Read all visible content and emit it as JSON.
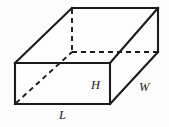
{
  "figure": {
    "shape_type": "rectangular-prism",
    "background_color": "#fcfcfc",
    "line_color": "#1b1b1b",
    "face_color": "#fdfdfd"
  },
  "labels": {
    "height": "H",
    "width": "W",
    "length": "L"
  },
  "geometry": {
    "front_face": {
      "top_left": [
        15,
        63
      ],
      "top_right": [
        110,
        63
      ],
      "bottom_right": [
        110,
        104
      ],
      "bottom_left": [
        15,
        104
      ]
    },
    "back_face": {
      "top_left": [
        72,
        8
      ],
      "top_right": [
        158,
        8
      ],
      "bottom_right": [
        158,
        52
      ],
      "bottom_left": [
        72,
        52
      ]
    },
    "visible_edges": [
      "front-top",
      "front-right",
      "front-bottom",
      "front-left",
      "top-left-slant",
      "top-back",
      "top-right-slant",
      "right-lower-slant",
      "back-right-vertical"
    ],
    "hidden_edges": [
      "back-left-vertical",
      "back-bottom",
      "bottom-left-slant"
    ]
  }
}
